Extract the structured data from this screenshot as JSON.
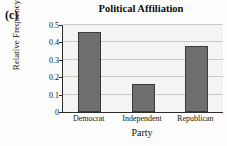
{
  "panel": {
    "label": "(c)"
  },
  "chart_data": {
    "type": "bar",
    "title": "Political Affiliation",
    "xlabel": "Party",
    "ylabel": "Relative Frequency",
    "categories": [
      "Democrat",
      "Independent",
      "Republican"
    ],
    "values": [
      0.46,
      0.163,
      0.378
    ],
    "ylim": [
      0,
      0.5
    ],
    "yticks": [
      0,
      0.1,
      0.2,
      0.3,
      0.4,
      0.5
    ],
    "ytick_labels": [
      "0",
      "0.1",
      "0.2",
      "0.3",
      "0.4",
      "0.5"
    ],
    "grid": "horizontal",
    "legend": "none",
    "bar_color": "#6e6e6e",
    "bar_edge_color": "#3a3a3a",
    "plot_background": "#f4f4f2",
    "axis_color": "#2b2b2b",
    "gridline_color": "#c9c9c6"
  }
}
